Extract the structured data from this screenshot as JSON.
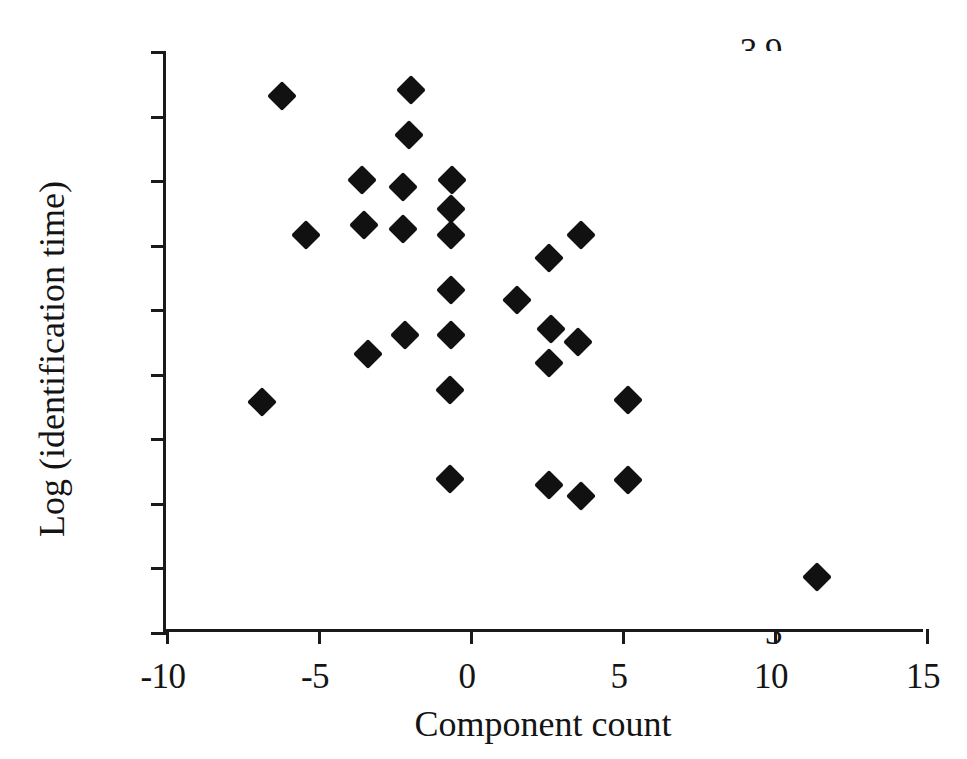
{
  "chart_data": {
    "type": "scatter",
    "title": "",
    "xlabel": "Component count",
    "ylabel": "Log (identification time)",
    "xlim": [
      -10,
      15
    ],
    "ylim": [
      3,
      3.9
    ],
    "xticks": [
      "-10",
      "-5",
      "0",
      "5",
      "10",
      "15"
    ],
    "xtick_values": [
      -10,
      -5,
      0,
      5,
      10,
      15
    ],
    "yticks": [
      "3",
      "3.1",
      "3.2",
      "3.3",
      "3.4",
      "3.5",
      "3.6",
      "3.7",
      "3.8",
      "3.9"
    ],
    "ytick_values": [
      3,
      3.1,
      3.2,
      3.3,
      3.4,
      3.5,
      3.6,
      3.7,
      3.8,
      3.9
    ],
    "grid": false,
    "legend": null,
    "marker": "filled-diamond",
    "marker_color": "#111111",
    "series": [
      {
        "name": "observations",
        "points": [
          [
            -6.2,
            3.83
          ],
          [
            -1.95,
            3.84
          ],
          [
            -2.0,
            3.77
          ],
          [
            -3.55,
            3.7
          ],
          [
            -0.6,
            3.7
          ],
          [
            -2.2,
            3.69
          ],
          [
            -0.62,
            3.655
          ],
          [
            -3.5,
            3.63
          ],
          [
            -2.2,
            3.625
          ],
          [
            -5.4,
            3.615
          ],
          [
            -0.62,
            3.615
          ],
          [
            3.65,
            3.615
          ],
          [
            2.6,
            3.58
          ],
          [
            1.55,
            3.515
          ],
          [
            -0.62,
            3.53
          ],
          [
            2.65,
            3.47
          ],
          [
            -2.15,
            3.46
          ],
          [
            -0.62,
            3.46
          ],
          [
            3.55,
            3.45
          ],
          [
            -3.35,
            3.43
          ],
          [
            2.6,
            3.417
          ],
          [
            -0.65,
            3.375
          ],
          [
            5.2,
            3.36
          ],
          [
            -6.85,
            3.357
          ],
          [
            5.2,
            3.235
          ],
          [
            -0.65,
            3.237
          ],
          [
            2.6,
            3.228
          ],
          [
            3.65,
            3.21
          ],
          [
            11.4,
            3.085
          ]
        ]
      }
    ]
  }
}
